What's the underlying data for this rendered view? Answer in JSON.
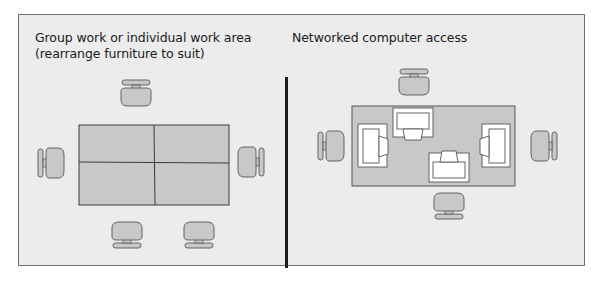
{
  "left_panel": {
    "title_line1": "Group work or individual work area",
    "title_line2": "(rearrange furniture to suit)",
    "furniture": {
      "tables": 4,
      "chairs": 5
    }
  },
  "right_panel": {
    "title": "Networked computer access",
    "furniture": {
      "desks": 1,
      "computer_workstations": 4,
      "chairs": 4
    }
  },
  "colors": {
    "background": "#ececec",
    "furniture_fill": "#c8c8c8",
    "outline": "#555555",
    "divider": "#1c1c1c",
    "monitor_fill": "#ffffff"
  }
}
